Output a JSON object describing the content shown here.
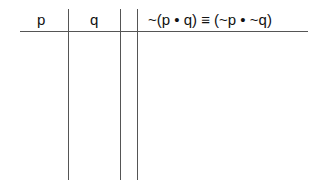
{
  "truth_table": {
    "columns": [
      {
        "label": "p"
      },
      {
        "label": "q"
      },
      {
        "label": ""
      },
      {
        "label": "~(p • q) ≡ (~p • ~q)"
      }
    ],
    "rows": []
  }
}
